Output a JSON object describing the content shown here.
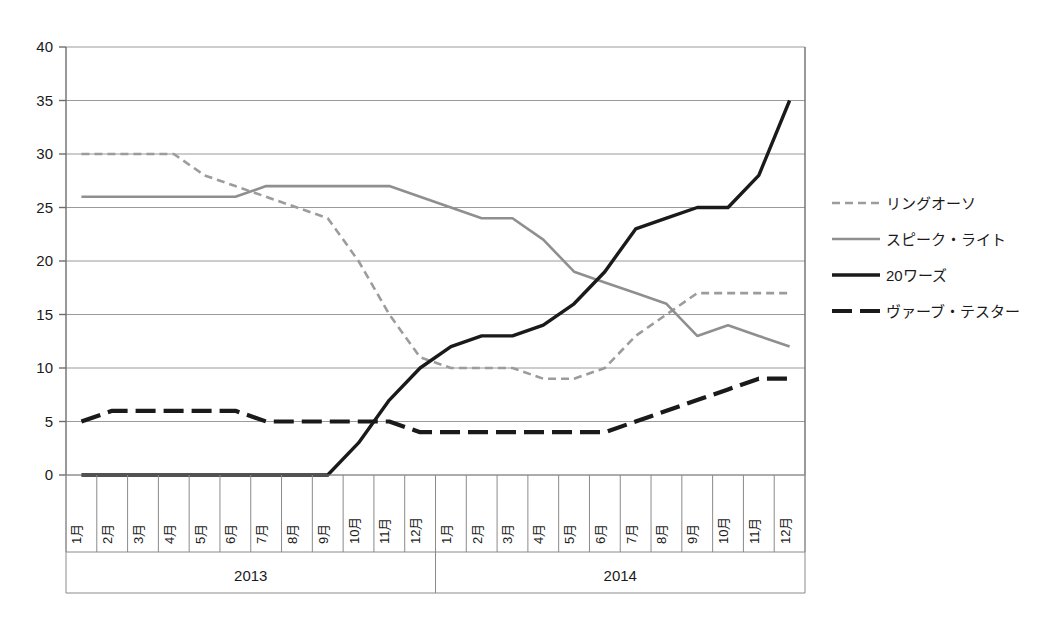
{
  "chart_data": {
    "type": "line",
    "title": "",
    "xlabel": "",
    "ylabel": "",
    "ylim": [
      0,
      40
    ],
    "y_ticks": [
      0,
      5,
      10,
      15,
      20,
      25,
      30,
      35,
      40
    ],
    "grid": true,
    "legend_position": "right",
    "groups": [
      {
        "label": "2013",
        "categories": [
          "1月",
          "2月",
          "3月",
          "4月",
          "5月",
          "6月",
          "7月",
          "8月",
          "9月",
          "10月",
          "11月",
          "12月"
        ]
      },
      {
        "label": "2014",
        "categories": [
          "1月",
          "2月",
          "3月",
          "4月",
          "5月",
          "6月",
          "7月",
          "8月",
          "9月",
          "10月",
          "11月",
          "12月"
        ]
      }
    ],
    "x": [
      "1月",
      "2月",
      "3月",
      "4月",
      "5月",
      "6月",
      "7月",
      "8月",
      "9月",
      "10月",
      "11月",
      "12月",
      "1月",
      "2月",
      "3月",
      "4月",
      "5月",
      "6月",
      "7月",
      "8月",
      "9月",
      "10月",
      "11月",
      "12月"
    ],
    "series": [
      {
        "name": "リングオーソ",
        "color": "#9c9c9c",
        "width": 2.6,
        "dash": "8,5",
        "values": [
          30,
          30,
          30,
          30,
          28,
          27,
          26,
          25,
          24,
          20,
          15,
          11,
          10,
          10,
          10,
          9,
          9,
          10,
          13,
          15,
          17,
          17,
          17,
          17
        ]
      },
      {
        "name": "スピーク・ライト",
        "color": "#8f8f8f",
        "width": 2.6,
        "dash": "none",
        "values": [
          26,
          26,
          26,
          26,
          26,
          26,
          27,
          27,
          27,
          27,
          27,
          26,
          25,
          24,
          24,
          22,
          19,
          18,
          17,
          16,
          13,
          14,
          13,
          12
        ]
      },
      {
        "name": "20ワーズ",
        "color": "#1a1a1a",
        "width": 3.4,
        "dash": "none",
        "values": [
          0,
          0,
          0,
          0,
          0,
          0,
          0,
          0,
          0,
          3,
          7,
          10,
          12,
          13,
          13,
          14,
          16,
          19,
          23,
          24,
          25,
          25,
          28,
          35
        ]
      },
      {
        "name": "ヴァーブ・テスター",
        "color": "#1a1a1a",
        "width": 4.2,
        "dash": "20,8",
        "values": [
          5,
          6,
          6,
          6,
          6,
          6,
          5,
          5,
          5,
          5,
          5,
          4,
          4,
          4,
          4,
          4,
          4,
          4,
          5,
          6,
          7,
          8,
          9,
          9
        ]
      }
    ]
  },
  "legend": {
    "items": [
      {
        "label": "リングオーソ"
      },
      {
        "label": "スピーク・ライト"
      },
      {
        "label": "20ワーズ"
      },
      {
        "label": "ヴァーブ・テスター"
      }
    ]
  }
}
